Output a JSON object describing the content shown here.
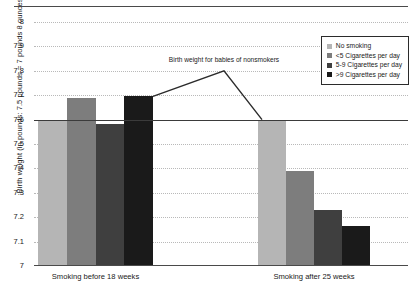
{
  "chart_data": {
    "type": "bar",
    "title": "",
    "xlabel": "",
    "ylabel": "Birth weight (in pounds: 7.5 pounds = 7 pounds 8 ounces)",
    "ylim": [
      7,
      8
    ],
    "ytick_labels": [
      "8",
      "7.9",
      "7.8",
      "7.7",
      "7.6",
      "7.5",
      "7.4",
      "7.3",
      "7.2",
      "7.1",
      "7"
    ],
    "ytick_values": [
      8,
      7.9,
      7.8,
      7.7,
      7.6,
      7.5,
      7.4,
      7.3,
      7.2,
      7.1,
      7
    ],
    "grid": true,
    "grid_style": "dotted horizontal",
    "legend_position": "top-right",
    "categories": [
      "Smoking before 18 weeks",
      "Smoking after 25 weeks"
    ],
    "series": [
      {
        "name": "No smoking",
        "color": "#b5b5b5",
        "values": [
          7.6,
          7.6
        ]
      },
      {
        "name": "<5 Cigarettes per day",
        "color": "#7d7d7d",
        "values": [
          7.69,
          7.39
        ]
      },
      {
        "name": "5-9 Cigarettes per day",
        "color": "#3f3f3f",
        "values": [
          7.58,
          7.23
        ]
      },
      {
        "name": ">9 Cigarettes per day",
        "color": "#1a1a1a",
        "values": [
          7.695,
          7.165
        ]
      }
    ],
    "reference_line": {
      "value": 7.6,
      "label": "Birth weight for babies of nonsmokers"
    },
    "annotations": [
      {
        "text": "Birth weight for babies of nonsmokers",
        "peak_value": 7.8
      }
    ]
  },
  "axis": {
    "y_title": "Birth weight (in pounds: 7.5 pounds = 7 pounds 8 ounces)"
  },
  "legend": {
    "items": [
      {
        "label": "No smoking",
        "color": "#b5b5b5"
      },
      {
        "label": "<5 Cigarettes per day",
        "color": "#7d7d7d"
      },
      {
        "label": "5-9 Cigarettes per day",
        "color": "#3f3f3f"
      },
      {
        "label": ">9 Cigarettes per day",
        "color": "#1a1a1a"
      }
    ]
  },
  "groups": [
    {
      "label": "Smoking before 18 weeks"
    },
    {
      "label": "Smoking after 25 weeks"
    }
  ],
  "annotation": {
    "text": "Birth weight for babies of nonsmokers"
  }
}
